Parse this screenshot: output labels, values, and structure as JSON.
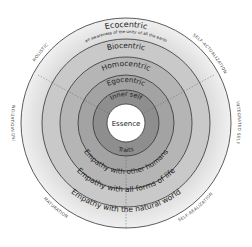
{
  "diagram": {
    "center": {
      "label": "Essence"
    },
    "rings": [
      {
        "name": "inner-self",
        "top": "Inner self",
        "bottom": "Traits",
        "radius": 33,
        "color": "#8f8f8f"
      },
      {
        "name": "egocentric",
        "top": "Egocentric",
        "bottom": "Empathy with other humans",
        "radius": 48,
        "color": "#a3a3a3"
      },
      {
        "name": "homocentric",
        "top": "Homocentric",
        "bottom": "Empathy with other humans",
        "radius": 66,
        "color": "#b4b4b4"
      },
      {
        "name": "biocentric",
        "top": "Biocentric",
        "bottom": "Empathy with all forms of life",
        "radius": 84,
        "color": "#cacaca"
      },
      {
        "name": "ecocentric",
        "top": "Ecocentric",
        "subtitle": "an awareness of the unity of all the earth",
        "bottom": "Empathy with the natural world",
        "radius": 105,
        "color": "#e4e4e4"
      }
    ],
    "top_labels": {
      "ecocentric": "Ecocentric",
      "ecocentric_sub": "an awareness of the unity of all the earth",
      "biocentric": "Biocentric",
      "homocentric": "Homocentric",
      "egocentric": "Egocentric",
      "inner_self": "Inner self"
    },
    "bottom_labels": {
      "traits": "Traits",
      "humans": "Empathy with other humans",
      "life": "Empathy with all forms of life",
      "world": "Empathy with the natural world"
    },
    "outer_labels": {
      "top_left": "HOLISTIC",
      "top_right": "SELF-ACTUALIZATION",
      "left": "INDIVIDUATION",
      "right": "INTEGRATED SELF",
      "bottom_left": "MATURATION",
      "bottom_right": "SELF-REALIZATION"
    },
    "colors": {
      "essence": "#ffffff",
      "stroke": "#333333"
    }
  }
}
